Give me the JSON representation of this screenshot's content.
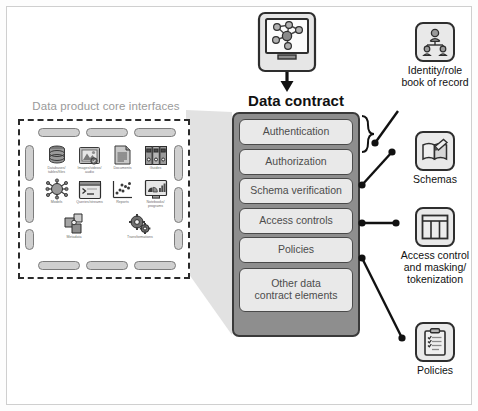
{
  "diagram": {
    "title_data_contract": "Data contract",
    "title_core_interfaces": "Data product core interfaces"
  },
  "core_interfaces": {
    "label": "Data product core interfaces",
    "icons": [
      {
        "name": "database-icon",
        "caption": "Databases/\ntables/files"
      },
      {
        "name": "image-icon",
        "caption": "Images/videos/\naudio"
      },
      {
        "name": "document-icon",
        "caption": "Documents"
      },
      {
        "name": "binders-icon",
        "caption": "Guides"
      },
      {
        "name": "model-icon",
        "caption": "Models"
      },
      {
        "name": "terminal-icon",
        "caption": "Queries/streams"
      },
      {
        "name": "scatter-icon",
        "caption": "Reports"
      },
      {
        "name": "notebook-icon",
        "caption": "Notebooks/\nprograms"
      },
      {
        "name": "metadata-icon",
        "caption": "Metadata"
      },
      {
        "name": "gears-icon",
        "caption": "Transformations"
      }
    ]
  },
  "monitor": {
    "name": "network-graph-monitor-icon"
  },
  "data_contract": {
    "title": "Data contract",
    "elements": [
      {
        "label": "Authentication"
      },
      {
        "label": "Authorization"
      },
      {
        "label": "Schema verification"
      },
      {
        "label": "Access controls"
      },
      {
        "label": "Policies"
      }
    ],
    "other": {
      "label": "Other data\ncontract elements"
    }
  },
  "right_nodes": [
    {
      "icon": "org-hierarchy-icon",
      "label": "Identity/role\nbook of record"
    },
    {
      "icon": "book-pencil-icon",
      "label": "Schemas"
    },
    {
      "icon": "table-grid-icon",
      "label": "Access control\nand masking/\ntokenization"
    },
    {
      "icon": "clipboard-list-icon",
      "label": "Policies"
    }
  ],
  "colors": {
    "frame_border": "#cfcfcf",
    "dashed_border": "#2b2b2b",
    "pill_fill": "#d0d0d0",
    "stack_fill": "#8e8e8e",
    "item_fill": "#e9e9e9",
    "item_border": "#4a4a4a",
    "text_dark": "#111111",
    "text_muted": "#9a9a9a",
    "funnel_fill": "#e2e2e2",
    "connector": "#111111"
  }
}
